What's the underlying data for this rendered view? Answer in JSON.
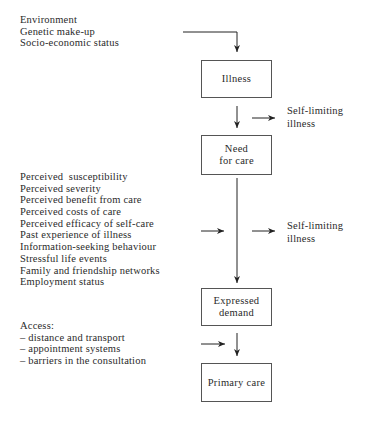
{
  "diagram": {
    "determinants": {
      "items": [
        "Environment",
        "Genetic make-up",
        "Socio-economic status"
      ]
    },
    "boxes": {
      "illness": "Illness",
      "need_for_care": [
        "Need",
        "for care"
      ],
      "expressed_demand": [
        "Expressed",
        "demand"
      ],
      "primary_care": "Primary care"
    },
    "self_limiting_1": [
      "Self-limiting",
      "illness"
    ],
    "self_limiting_2": [
      "Self-limiting",
      "illness"
    ],
    "factors": {
      "items": [
        "Perceived  susceptibility",
        "Perceived severity",
        "Perceived benefit from care",
        "Perceived costs of care",
        "Perceived efficacy of self-care",
        "Past experience of illness",
        "Information-seeking behaviour",
        "Stressful life events",
        "Family and friendship networks",
        "Employment status"
      ]
    },
    "access": {
      "title": "Access:",
      "items": [
        "– distance and transport",
        "– appointment systems",
        "– barriers in the consultation"
      ]
    },
    "colors": {
      "line": "#222222",
      "box_border": "#555555",
      "text": "#2a2a2a"
    }
  }
}
